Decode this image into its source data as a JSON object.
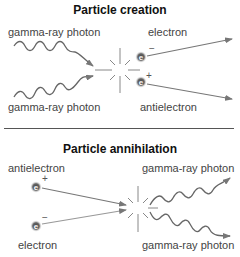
{
  "creation": {
    "title": "Particle creation",
    "photon_top_label": "gamma-ray photon",
    "photon_bottom_label": "gamma-ray photon",
    "electron_label": "electron",
    "antielectron_label": "antielectron",
    "electron_symbol": "e",
    "electron_charge": "−",
    "antielectron_charge": "+"
  },
  "annihilation": {
    "title": "Particle annihilation",
    "antielectron_label": "antielectron",
    "electron_label": "electron",
    "photon_top_label": "gamma-ray photon",
    "photon_bottom_label": "gamma-ray photon",
    "antielectron_charge": "+",
    "electron_charge": "−"
  },
  "colors": {
    "arrow": "#777777",
    "particle": "#555555",
    "text": "#444444"
  }
}
